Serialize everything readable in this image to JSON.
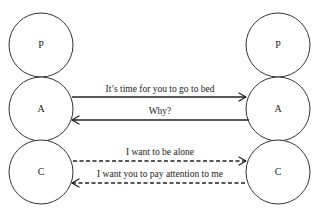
{
  "diagram": {
    "type": "transactional-analysis",
    "left_person": {
      "states": [
        {
          "id": "P",
          "label": "P"
        },
        {
          "id": "A",
          "label": "A"
        },
        {
          "id": "C",
          "label": "C"
        }
      ]
    },
    "right_person": {
      "states": [
        {
          "id": "P",
          "label": "P"
        },
        {
          "id": "A",
          "label": "A"
        },
        {
          "id": "C",
          "label": "C"
        }
      ]
    },
    "transactions": [
      {
        "from": "left.A",
        "to": "right.A",
        "style": "solid",
        "label": "It’s time for you to go to bed"
      },
      {
        "from": "right.A",
        "to": "left.A",
        "style": "solid",
        "label": "Why?"
      },
      {
        "from": "left.C",
        "to": "right.C",
        "style": "dashed",
        "label": "I want to be alone"
      },
      {
        "from": "right.C",
        "to": "left.C",
        "style": "dashed",
        "label": "I want you to pay attention to me"
      }
    ]
  }
}
